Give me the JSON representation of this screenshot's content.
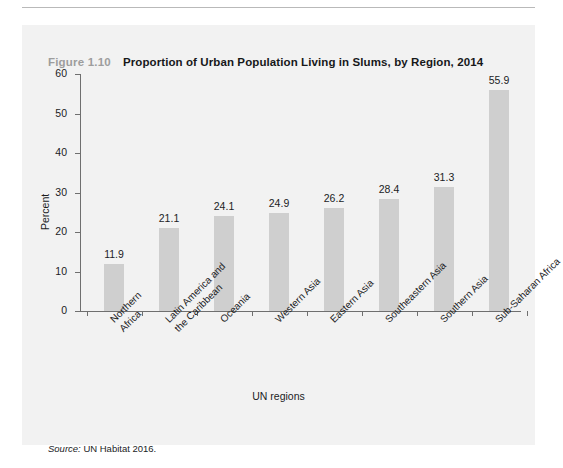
{
  "figure": {
    "number_label": "Figure 1.10",
    "title": "Proportion of Urban Population Living in Slums, by Region, 2014",
    "source_word": "Source:",
    "source_text": "UN Habitat 2016.",
    "panel_color": "#f2f2f2",
    "bar_color": "#cfcfcf",
    "axis_color": "#6f6f6f",
    "figno_color": "#9d9d9d"
  },
  "chart_data": {
    "type": "bar",
    "title": "Proportion of Urban Population Living in Slums, by Region, 2014",
    "xlabel": "UN regions",
    "ylabel": "Percent",
    "ylim": [
      0,
      60
    ],
    "yticks": [
      0,
      10,
      20,
      30,
      40,
      50,
      60
    ],
    "ytick_labels": [
      "0",
      "10",
      "20",
      "30",
      "40",
      "50",
      "60"
    ],
    "grid": false,
    "legend": null,
    "categories": [
      "Northern Africa",
      "Latin America and the Caribbean",
      "Oceania",
      "Western Asia",
      "Eastern Asia",
      "Southeastern Asia",
      "Southern Asia",
      "Sub-Saharan Africa"
    ],
    "category_lines": [
      [
        "Northern",
        "Africa"
      ],
      [
        "Latin America and",
        "the Caribbean"
      ],
      [
        "Oceania"
      ],
      [
        "Western Asia"
      ],
      [
        "Eastern Asia"
      ],
      [
        "Southeastern Asia"
      ],
      [
        "Southern Asia"
      ],
      [
        "Sub-Saharan Africa"
      ]
    ],
    "values": [
      11.9,
      21.1,
      24.1,
      24.9,
      26.2,
      28.4,
      31.3,
      55.9
    ],
    "value_labels": [
      "11.9",
      "21.1",
      "24.1",
      "24.9",
      "26.2",
      "28.4",
      "31.3",
      "55.9"
    ]
  }
}
